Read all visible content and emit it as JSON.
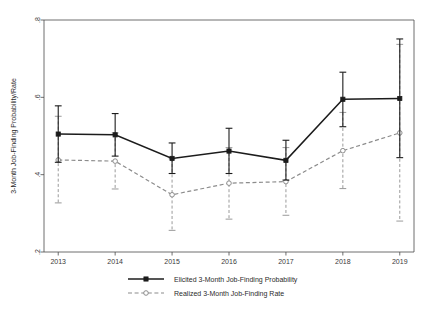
{
  "chart_data": {
    "type": "line",
    "title": "",
    "xlabel": "",
    "ylabel": "3-Month Job-Finding Probability/Rate",
    "categories": [
      "2013",
      "2014",
      "2015",
      "2016",
      "2017",
      "2018",
      "2019"
    ],
    "x": [
      2013,
      2014,
      2015,
      2016,
      2017,
      2018,
      2019
    ],
    "xlim": [
      2012.75,
      2019.25
    ],
    "ylim": [
      0.2,
      0.8
    ],
    "yticks": [
      0.2,
      0.4,
      0.6,
      0.8
    ],
    "ytick_labels": [
      ".2",
      ".4",
      ".6",
      ".8"
    ],
    "xtick_labels": [
      "2013",
      "2014",
      "2015",
      "2016",
      "2017",
      "2018",
      "2019"
    ],
    "grid": false,
    "legend_position": "bottom",
    "series": [
      {
        "name": "Elicited 3-Month Job-Finding Probability",
        "marker": "square",
        "linestyle": "solid",
        "color": "#1c1c1c",
        "values": [
          0.505,
          0.503,
          0.442,
          0.461,
          0.437,
          0.595,
          0.597
        ],
        "err_low": [
          0.432,
          0.448,
          0.403,
          0.403,
          0.386,
          0.524,
          0.444
        ],
        "err_high": [
          0.578,
          0.558,
          0.482,
          0.52,
          0.489,
          0.665,
          0.751
        ]
      },
      {
        "name": "Realized 3-Month Job-Finding Rate",
        "marker": "circle",
        "linestyle": "dashed",
        "color": "#8c8c8c",
        "values": [
          0.438,
          0.435,
          0.348,
          0.378,
          0.382,
          0.462,
          0.508
        ],
        "err_low": [
          0.327,
          0.363,
          0.256,
          0.285,
          0.295,
          0.364,
          0.28
        ],
        "err_high": [
          0.551,
          0.508,
          0.441,
          0.47,
          0.47,
          0.561,
          0.737
        ]
      }
    ]
  },
  "legend": {
    "items": [
      {
        "label": "Elicited 3-Month Job-Finding Probability",
        "style": "solid-square"
      },
      {
        "label": "Realized 3-Month Job-Finding Rate",
        "style": "dashed-circle"
      }
    ]
  },
  "colors": {
    "elicited": "#1c1c1c",
    "realized": "#8c8c8c",
    "axis": "#4a4a4a",
    "background": "#ffffff"
  }
}
